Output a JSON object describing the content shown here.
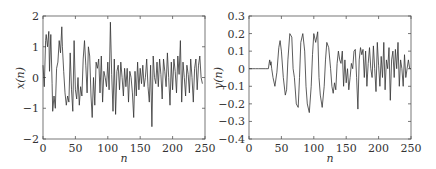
{
  "chart_data": [
    {
      "type": "line",
      "title": "",
      "xlabel": "n",
      "ylabel": "x(n)",
      "xlim": [
        0,
        250
      ],
      "ylim": [
        -2,
        2
      ],
      "xticks": [
        0,
        50,
        100,
        150,
        200,
        250
      ],
      "xtick_labels": [
        "0",
        "50",
        "100",
        "150",
        "200",
        "250"
      ],
      "yticks": [
        -2,
        -1,
        0,
        1,
        2
      ],
      "ytick_labels": [
        "−2",
        "−1",
        "0",
        "1",
        "2"
      ],
      "grid": false,
      "series": [
        {
          "name": "x(n)",
          "x": [
            0,
            2,
            4,
            5,
            7,
            9,
            10,
            12,
            14,
            15,
            17,
            19,
            21,
            23,
            25,
            27,
            29,
            30,
            32,
            34,
            36,
            38,
            40,
            42,
            44,
            46,
            48,
            50,
            52,
            54,
            56,
            58,
            60,
            62,
            64,
            66,
            68,
            70,
            72,
            74,
            76,
            78,
            80,
            82,
            84,
            86,
            88,
            90,
            92,
            94,
            96,
            98,
            100,
            102,
            104,
            106,
            108,
            110,
            112,
            114,
            116,
            118,
            120,
            122,
            124,
            126,
            128,
            130,
            132,
            134,
            136,
            138,
            140,
            142,
            144,
            146,
            148,
            150,
            152,
            154,
            156,
            158,
            160,
            162,
            164,
            166,
            168,
            170,
            172,
            174,
            176,
            178,
            180,
            182,
            184,
            186,
            188,
            190,
            192,
            194,
            196,
            198,
            200,
            202,
            204,
            206,
            208,
            210,
            212,
            214,
            216,
            218,
            220,
            222,
            224,
            226,
            228,
            230,
            232,
            234,
            236,
            238,
            240,
            242,
            244,
            246,
            248,
            250
          ],
          "y": [
            0.4,
            -0.3,
            1.2,
            1.4,
            1.0,
            1.5,
            0.2,
            1.4,
            -0.2,
            -1.1,
            -0.6,
            -1.0,
            0.3,
            0.5,
            1.2,
            0.8,
            1.65,
            1.0,
            0.2,
            -0.5,
            -0.9,
            -0.6,
            -0.8,
            0.8,
            -0.4,
            -1.1,
            1.2,
            -0.4,
            -0.7,
            0.0,
            -0.9,
            -0.3,
            -0.6,
            0.6,
            1.2,
            0.4,
            -0.5,
            1.0,
            0.7,
            -0.6,
            -1.3,
            0.0,
            -0.9,
            0.5,
            0.3,
            0.6,
            -0.5,
            0.7,
            -0.8,
            0.2,
            0.0,
            -0.3,
            0.5,
            -0.4,
            1.8,
            0.1,
            -1.1,
            0.6,
            -1.2,
            0.2,
            0.4,
            -0.4,
            0.5,
            0.0,
            -0.6,
            0.3,
            -0.3,
            0.3,
            -0.8,
            0.2,
            0.0,
            -0.5,
            -1.3,
            0.2,
            -0.6,
            0.5,
            -0.4,
            0.3,
            -0.2,
            0.4,
            -0.3,
            0.0,
            0.6,
            -0.3,
            -0.8,
            0.4,
            -1.6,
            0.7,
            0.0,
            -0.2,
            0.5,
            -0.3,
            0.6,
            0.1,
            -0.7,
            0.6,
            0.2,
            -0.3,
            0.8,
            0.0,
            -0.9,
            0.5,
            -0.4,
            0.6,
            0.2,
            -0.5,
            0.7,
            0.1,
            1.2,
            -0.8,
            0.5,
            0.0,
            -0.6,
            0.4,
            0.1,
            -0.5,
            0.6,
            0.0,
            -0.8,
            0.3,
            0.6,
            -0.4,
            0.4,
            0.7,
            0.0,
            -0.2
          ]
        }
      ]
    },
    {
      "type": "line",
      "title": "",
      "xlabel": "n",
      "ylabel": "y(n)",
      "xlim": [
        0,
        250
      ],
      "ylim": [
        -0.4,
        0.3
      ],
      "xticks": [
        0,
        50,
        100,
        150,
        200,
        250
      ],
      "xtick_labels": [
        "0",
        "50",
        "100",
        "150",
        "200",
        "250"
      ],
      "yticks": [
        -0.4,
        -0.3,
        -0.2,
        -0.1,
        0,
        0.1,
        0.2,
        0.3
      ],
      "ytick_labels": [
        "−0.4",
        "−0.3",
        "−0.2",
        "−0.1",
        "0",
        "0.1",
        "0.2",
        "0.3"
      ],
      "grid": false,
      "series": [
        {
          "name": "y(n)",
          "x": [
            0,
            5,
            10,
            15,
            20,
            25,
            30,
            31,
            32,
            33,
            34,
            35,
            37,
            40,
            43,
            46,
            48,
            50,
            53,
            56,
            58,
            60,
            63,
            66,
            68,
            70,
            73,
            76,
            78,
            80,
            83,
            86,
            88,
            90,
            93,
            96,
            98,
            100,
            103,
            106,
            108,
            110,
            113,
            116,
            118,
            120,
            123,
            126,
            128,
            130,
            132,
            134,
            136,
            138,
            140,
            142,
            144,
            146,
            148,
            150,
            152,
            154,
            156,
            158,
            160,
            162,
            164,
            166,
            168,
            170,
            172,
            174,
            176,
            178,
            180,
            182,
            184,
            186,
            188,
            190,
            192,
            194,
            196,
            198,
            200,
            202,
            204,
            206,
            208,
            210,
            212,
            214,
            216,
            218,
            220,
            222,
            224,
            226,
            228,
            230,
            232,
            234,
            236,
            238,
            240,
            242,
            244,
            246,
            248,
            250
          ],
          "y": [
            0,
            0,
            0,
            0,
            0,
            0,
            0,
            0.03,
            0.05,
            0.02,
            0.04,
            0.0,
            -0.05,
            -0.1,
            -0.02,
            0.12,
            0.16,
            0.1,
            -0.05,
            -0.15,
            -0.12,
            0.05,
            0.2,
            0.18,
            0.0,
            -0.05,
            -0.2,
            -0.22,
            -0.05,
            0.15,
            0.2,
            0.1,
            -0.1,
            -0.2,
            -0.25,
            -0.1,
            0.08,
            0.2,
            0.15,
            0.21,
            -0.05,
            -0.15,
            -0.22,
            -0.1,
            0.05,
            0.15,
            0.12,
            0.0,
            -0.1,
            -0.14,
            -0.08,
            -0.12,
            0.03,
            0.1,
            0.05,
            0.03,
            0.1,
            -0.1,
            0.05,
            -0.08,
            0.0,
            -0.12,
            -0.05,
            0.03,
            0.0,
            0.1,
            0.11,
            -0.05,
            -0.23,
            0.05,
            0.12,
            0.08,
            0.11,
            -0.05,
            0.1,
            -0.1,
            0.03,
            0.12,
            0.0,
            -0.05,
            0.13,
            0.0,
            -0.13,
            0.15,
            0.02,
            -0.1,
            0.07,
            -0.05,
            0.15,
            -0.12,
            0.05,
            0.0,
            0.12,
            -0.18,
            0.05,
            0.1,
            -0.05,
            0.11,
            0.0,
            0.15,
            -0.1,
            0.05,
            0.0,
            -0.1,
            0.08,
            -0.05,
            0.0,
            0.05,
            0.0,
            0.0
          ]
        }
      ]
    }
  ]
}
